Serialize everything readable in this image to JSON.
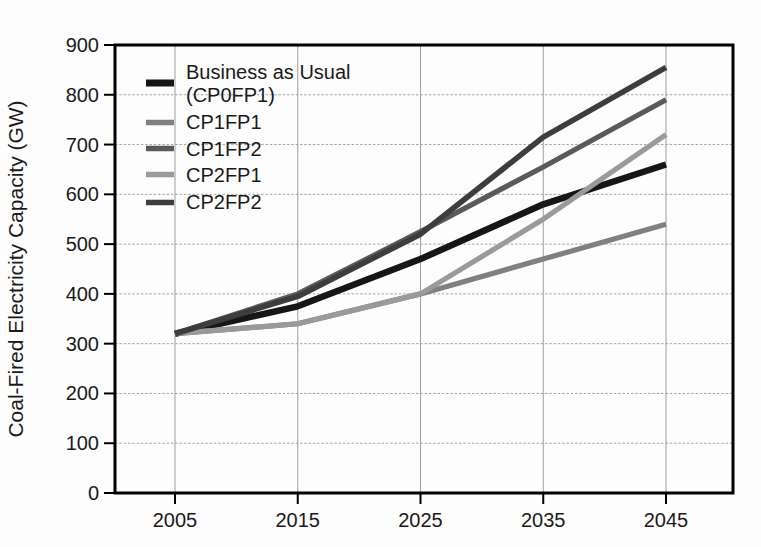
{
  "figure": {
    "background_color": "#fdfdfd",
    "text_color": "#1a1a1a",
    "frame_color": "#000000",
    "gridline_color": "#a4a4a4"
  },
  "y_axis": {
    "title": "Coal-Fired Electricity Capacity (GW)",
    "tick_labels": [
      "0",
      "100",
      "200",
      "300",
      "400",
      "500",
      "600",
      "700",
      "800",
      "900"
    ]
  },
  "x_axis": {
    "tick_labels": [
      "2005",
      "2015",
      "2025",
      "2035",
      "2045"
    ]
  },
  "legend": {
    "items": [
      {
        "label_lines": [
          "Business as Usual",
          "(CP0FP1)"
        ],
        "series": "Business as Usual (CP0FP1)",
        "color": "#161616"
      },
      {
        "label_lines": [
          "CP1FP1"
        ],
        "series": "CP1FP1",
        "color": "#808080"
      },
      {
        "label_lines": [
          "CP1FP2"
        ],
        "series": "CP1FP2",
        "color": "#5a5a5a"
      },
      {
        "label_lines": [
          "CP2FP1"
        ],
        "series": "CP2FP1",
        "color": "#9a9a9a"
      },
      {
        "label_lines": [
          "CP2FP2"
        ],
        "series": "CP2FP2",
        "color": "#3d3d3d"
      }
    ]
  },
  "chart_data": {
    "type": "line",
    "title": "",
    "xlabel": "",
    "ylabel": "Coal-Fired Electricity Capacity (GW)",
    "units": "GW",
    "x": [
      2005,
      2015,
      2025,
      2035,
      2045
    ],
    "xlim": [
      2000,
      2050.5
    ],
    "ylim": [
      0,
      900
    ],
    "y_tick_step": 100,
    "grid": true,
    "legend_position": "upper-left-inside",
    "series": [
      {
        "name": "Business as Usual (CP0FP1)",
        "color": "#161616",
        "line_width": 6.5,
        "values": [
          320,
          375,
          470,
          580,
          660
        ]
      },
      {
        "name": "CP1FP1",
        "color": "#808080",
        "line_width": 5.2,
        "values": [
          320,
          340,
          400,
          470,
          540
        ]
      },
      {
        "name": "CP1FP2",
        "color": "#5a5a5a",
        "line_width": 5.2,
        "values": [
          320,
          400,
          525,
          655,
          790
        ]
      },
      {
        "name": "CP2FP1",
        "color": "#9a9a9a",
        "line_width": 5.2,
        "values": [
          320,
          340,
          400,
          550,
          720
        ]
      },
      {
        "name": "CP2FP2",
        "color": "#3d3d3d",
        "line_width": 5.6,
        "values": [
          320,
          395,
          520,
          715,
          855
        ]
      }
    ]
  }
}
